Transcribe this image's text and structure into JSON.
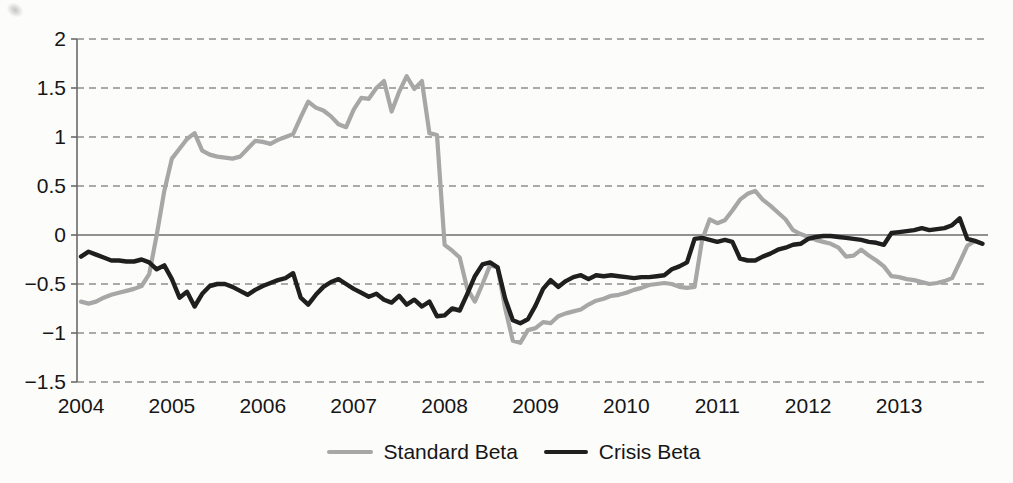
{
  "figure": {
    "background": "#fcfcfb",
    "text_color": "#161616"
  },
  "chart_data": {
    "type": "line",
    "title": "",
    "xlabel": "",
    "ylabel": "",
    "x_axis": {
      "labels": [
        "2004",
        "2005",
        "2006",
        "2007",
        "2008",
        "2009",
        "2010",
        "2011",
        "2012",
        "2013"
      ],
      "points_per_label": 12,
      "note": "monthly data, Jan 2004 - Dec 2013"
    },
    "y_axis": {
      "range": [
        -1.5,
        2
      ],
      "ticks": [
        2,
        1.5,
        1,
        0.5,
        0,
        -0.5,
        -1,
        -1.5
      ],
      "tick_labels": [
        "2",
        "1.5",
        "1",
        "0.5",
        "0",
        "−0.5",
        "−1",
        "−1.5"
      ]
    },
    "grid": {
      "dashed_gridlines": true,
      "zero_line_solid": true,
      "gridline_color": "#8f8f8f",
      "zero_line_color": "#6e6e6e",
      "axis_color": "#6a6a6a"
    },
    "legend": {
      "position": "bottom-center",
      "entries": [
        {
          "label": "Standard Beta",
          "color": "#a7a7a7"
        },
        {
          "label": "Crisis Beta",
          "color": "#1f1f1f"
        }
      ]
    },
    "series": [
      {
        "name": "Standard Beta",
        "color": "#a7a7a7",
        "stroke_width": 4.2,
        "values": [
          -0.68,
          -0.7,
          -0.68,
          -0.64,
          -0.61,
          -0.59,
          -0.57,
          -0.55,
          -0.52,
          -0.4,
          0.0,
          0.45,
          0.78,
          0.88,
          0.98,
          1.04,
          0.86,
          0.82,
          0.8,
          0.79,
          0.78,
          0.8,
          0.88,
          0.96,
          0.95,
          0.93,
          0.97,
          1.0,
          1.03,
          1.2,
          1.36,
          1.3,
          1.27,
          1.21,
          1.13,
          1.1,
          1.28,
          1.4,
          1.39,
          1.5,
          1.57,
          1.26,
          1.46,
          1.62,
          1.49,
          1.57,
          1.04,
          1.02,
          -0.1,
          -0.16,
          -0.23,
          -0.55,
          -0.68,
          -0.5,
          -0.31,
          -0.33,
          -0.75,
          -1.08,
          -1.1,
          -0.97,
          -0.95,
          -0.89,
          -0.9,
          -0.83,
          -0.8,
          -0.78,
          -0.76,
          -0.71,
          -0.67,
          -0.65,
          -0.62,
          -0.61,
          -0.59,
          -0.56,
          -0.54,
          -0.51,
          -0.5,
          -0.49,
          -0.5,
          -0.53,
          -0.54,
          -0.53,
          -0.05,
          0.16,
          0.12,
          0.15,
          0.25,
          0.36,
          0.42,
          0.45,
          0.36,
          0.3,
          0.23,
          0.16,
          0.05,
          0.01,
          -0.02,
          -0.05,
          -0.07,
          -0.09,
          -0.13,
          -0.22,
          -0.21,
          -0.15,
          -0.21,
          -0.26,
          -0.32,
          -0.42,
          -0.43,
          -0.45,
          -0.46,
          -0.48,
          -0.5,
          -0.49,
          -0.47,
          -0.44,
          -0.28,
          -0.11,
          -0.06,
          -0.09
        ]
      },
      {
        "name": "Crisis Beta",
        "color": "#1f1f1f",
        "stroke_width": 4.4,
        "values": [
          -0.22,
          -0.17,
          -0.2,
          -0.23,
          -0.26,
          -0.26,
          -0.27,
          -0.27,
          -0.25,
          -0.28,
          -0.35,
          -0.31,
          -0.45,
          -0.64,
          -0.58,
          -0.73,
          -0.6,
          -0.52,
          -0.5,
          -0.5,
          -0.53,
          -0.57,
          -0.61,
          -0.56,
          -0.52,
          -0.49,
          -0.46,
          -0.44,
          -0.39,
          -0.64,
          -0.71,
          -0.61,
          -0.53,
          -0.48,
          -0.45,
          -0.5,
          -0.55,
          -0.59,
          -0.63,
          -0.6,
          -0.66,
          -0.69,
          -0.62,
          -0.71,
          -0.66,
          -0.73,
          -0.68,
          -0.83,
          -0.82,
          -0.75,
          -0.77,
          -0.6,
          -0.42,
          -0.3,
          -0.28,
          -0.33,
          -0.65,
          -0.87,
          -0.9,
          -0.86,
          -0.72,
          -0.55,
          -0.46,
          -0.53,
          -0.47,
          -0.43,
          -0.41,
          -0.45,
          -0.41,
          -0.42,
          -0.41,
          -0.42,
          -0.43,
          -0.44,
          -0.43,
          -0.43,
          -0.42,
          -0.41,
          -0.35,
          -0.32,
          -0.28,
          -0.04,
          -0.03,
          -0.05,
          -0.07,
          -0.05,
          -0.07,
          -0.24,
          -0.26,
          -0.26,
          -0.22,
          -0.19,
          -0.15,
          -0.13,
          -0.1,
          -0.09,
          -0.04,
          -0.02,
          -0.01,
          -0.01,
          -0.02,
          -0.03,
          -0.04,
          -0.05,
          -0.07,
          -0.08,
          -0.1,
          0.02,
          0.03,
          0.04,
          0.05,
          0.07,
          0.05,
          0.06,
          0.07,
          0.1,
          0.17,
          -0.04,
          -0.06,
          -0.09
        ]
      }
    ]
  }
}
